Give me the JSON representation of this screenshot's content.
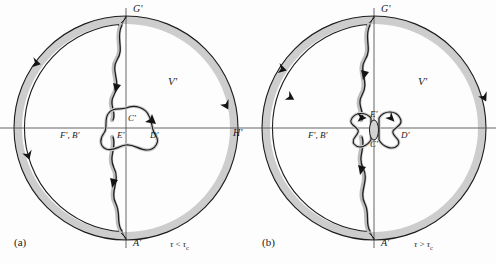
{
  "figure": {
    "domain": "Diagram",
    "background_color": "#ffffff",
    "ink_color": "#1a1a1a",
    "shade_color": "#b8b8b8",
    "shade_color_light": "#cfcfcf"
  },
  "panels": [
    {
      "id": "a",
      "caption": "(a)",
      "condition": {
        "symbol": "τ",
        "relation": "<",
        "reference": "τ",
        "subscript": "c",
        "text": "τ < τc"
      },
      "region_label": "V'",
      "labels": [
        {
          "name": "point-g-prime",
          "text": "G'",
          "x": 131,
          "y": 7
        },
        {
          "name": "point-a-prime",
          "text": "A'",
          "x": 131,
          "y": 240
        },
        {
          "name": "point-h-prime",
          "text": "H'",
          "x": 233,
          "y": 128
        },
        {
          "name": "point-f-b-prime",
          "text": "F', B'",
          "x": 85,
          "y": 133
        },
        {
          "name": "point-c-prime",
          "text": "C'",
          "x": 124,
          "y": 119
        },
        {
          "name": "point-e-prime",
          "text": "E'",
          "x": 125,
          "y": 134
        },
        {
          "name": "point-d-prime",
          "text": "D'",
          "x": 153,
          "y": 134
        },
        {
          "name": "region-v-prime",
          "text": "V'",
          "x": 168,
          "y": 80
        }
      ]
    },
    {
      "id": "b",
      "caption": "(b)",
      "condition": {
        "symbol": "τ",
        "relation": ">",
        "reference": "τ",
        "subscript": "c",
        "text": "τ > τc"
      },
      "region_label": "V'",
      "labels": [
        {
          "name": "point-g-prime",
          "text": "G'",
          "x": 131,
          "y": 7
        },
        {
          "name": "point-a-prime",
          "text": "A'",
          "x": 131,
          "y": 240
        },
        {
          "name": "point-f-b-prime",
          "text": "F', B'",
          "x": 85,
          "y": 133
        },
        {
          "name": "point-e-prime",
          "text": "E'",
          "x": 125,
          "y": 115
        },
        {
          "name": "point-c-prime",
          "text": "C'",
          "x": 125,
          "y": 141
        },
        {
          "name": "point-d-prime",
          "text": "D'",
          "x": 156,
          "y": 133
        },
        {
          "name": "region-v-prime",
          "text": "V'",
          "x": 170,
          "y": 80
        }
      ]
    }
  ],
  "geometry": {
    "center_a": {
      "x": 126,
      "y": 128
    },
    "center_b": {
      "x": 126,
      "y": 128
    },
    "outer_radius": 112,
    "inner_radius": 104,
    "axis_horizontal_y": 128,
    "axis_vertical_x": 126
  }
}
